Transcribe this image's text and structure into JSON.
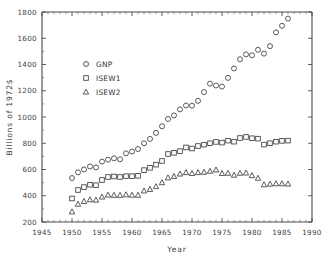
{
  "chart_data": {
    "type": "scatter",
    "title": "",
    "xlabel": "Year",
    "ylabel": "Billions of 1972$",
    "xlim": [
      1945,
      1990
    ],
    "ylim": [
      200,
      1800
    ],
    "xticks": [
      1945,
      1950,
      1955,
      1960,
      1965,
      1970,
      1975,
      1980,
      1985,
      1990
    ],
    "yticks": [
      200,
      400,
      600,
      800,
      1000,
      1200,
      1400,
      1600,
      1800
    ],
    "xtick_labels": [
      "1945",
      "1950",
      "1955",
      "1960",
      "1965",
      "1970",
      "1975",
      "1980",
      "1985",
      "1990"
    ],
    "ytick_labels": [
      "200",
      "400",
      "600",
      "800",
      "1000",
      "1200",
      "1400",
      "1600",
      "1800"
    ],
    "minor_tick_step": 1,
    "grid": false,
    "legend_position": "upper-left-inset",
    "x": [
      1950,
      1951,
      1952,
      1953,
      1954,
      1955,
      1956,
      1957,
      1958,
      1959,
      1960,
      1961,
      1962,
      1963,
      1964,
      1965,
      1966,
      1967,
      1968,
      1969,
      1970,
      1971,
      1972,
      1973,
      1974,
      1975,
      1976,
      1977,
      1978,
      1979,
      1980,
      1981,
      1982,
      1983,
      1984,
      1985,
      1986
    ],
    "series": [
      {
        "name": "GNP",
        "marker": "circle",
        "values": [
          535,
          578,
          600,
          623,
          616,
          660,
          675,
          685,
          678,
          723,
          737,
          756,
          800,
          833,
          879,
          929,
          985,
          1012,
          1058,
          1088,
          1086,
          1123,
          1190,
          1254,
          1240,
          1232,
          1298,
          1370,
          1440,
          1477,
          1470,
          1512,
          1483,
          1540,
          1645,
          1695,
          1750
        ]
      },
      {
        "name": "ISEW1",
        "marker": "square",
        "values": [
          379,
          444,
          466,
          484,
          480,
          520,
          543,
          547,
          543,
          549,
          549,
          552,
          595,
          613,
          637,
          665,
          718,
          727,
          740,
          768,
          760,
          779,
          789,
          800,
          810,
          805,
          820,
          812,
          840,
          848,
          838,
          835,
          790,
          800,
          812,
          818,
          820
        ]
      },
      {
        "name": "ISEW2",
        "marker": "triangle",
        "values": [
          278,
          336,
          357,
          370,
          367,
          391,
          406,
          404,
          404,
          408,
          405,
          404,
          437,
          449,
          470,
          500,
          537,
          548,
          566,
          577,
          570,
          577,
          580,
          587,
          597,
          570,
          572,
          557,
          572,
          574,
          554,
          534,
          484,
          489,
          492,
          492,
          490
        ]
      }
    ],
    "legend": [
      {
        "label": "GNP",
        "marker": "circle"
      },
      {
        "label": "ISEW1",
        "marker": "square"
      },
      {
        "label": "ISEW2",
        "marker": "triangle"
      }
    ]
  }
}
